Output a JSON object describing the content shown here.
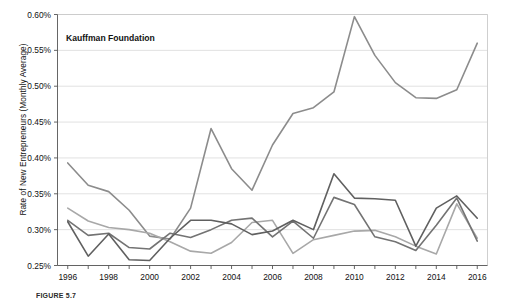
{
  "figure": {
    "caption": "FIGURE 5.7",
    "annotation": "Kauffman Foundation",
    "ylabel": "Rate of New Entrepreneurs (Monthly Average)"
  },
  "chart_data": {
    "type": "line",
    "title": "",
    "annotation": "Kauffman Foundation",
    "xlabel": "",
    "ylabel": "Rate of New Entrepreneurs (Monthly Average)",
    "xlim": [
      1995.5,
      2016.5
    ],
    "ylim": [
      0.0025,
      0.006
    ],
    "ylim_percent": [
      0.25,
      0.6
    ],
    "grid": true,
    "legend": "none",
    "y_tick_labels": [
      "0.60%",
      "0.55%",
      "0.50%",
      "0.45%",
      "0.40%",
      "0.35%",
      "0.30%",
      "0.25%"
    ],
    "y_tick_values": [
      0.6,
      0.55,
      0.5,
      0.45,
      0.4,
      0.35,
      0.3,
      0.25
    ],
    "x_tick_labels": [
      "1996",
      "1998",
      "2000",
      "2002",
      "2004",
      "2006",
      "2008",
      "2010",
      "2012",
      "2014",
      "2016"
    ],
    "x_tick_values": [
      1996,
      1998,
      2000,
      2002,
      2004,
      2006,
      2008,
      2010,
      2012,
      2014,
      2016
    ],
    "x_minor_ticks": [
      1997,
      1999,
      2001,
      2003,
      2005,
      2007,
      2009,
      2011,
      2013,
      2015
    ],
    "x": [
      1996,
      1997,
      1998,
      1999,
      2000,
      2001,
      2002,
      2003,
      2004,
      2005,
      2006,
      2007,
      2008,
      2009,
      2010,
      2011,
      2012,
      2013,
      2014,
      2015,
      2016
    ],
    "series": [
      {
        "name": "series-1",
        "color": "#8c8c8c",
        "values": [
          0.393,
          0.362,
          0.353,
          0.327,
          0.291,
          0.287,
          0.33,
          0.441,
          0.385,
          0.355,
          0.418,
          0.462,
          0.47,
          0.492,
          0.597,
          0.543,
          0.505,
          0.484,
          0.483,
          0.495,
          0.56
        ]
      },
      {
        "name": "series-2",
        "color": "#a8a8a8",
        "values": [
          0.33,
          0.312,
          0.303,
          0.3,
          0.295,
          0.283,
          0.27,
          0.267,
          0.282,
          0.31,
          0.313,
          0.267,
          0.286,
          0.292,
          0.298,
          0.299,
          0.29,
          0.277,
          0.266,
          0.336,
          0.288
        ]
      },
      {
        "name": "series-3",
        "color": "#737373",
        "values": [
          0.313,
          0.292,
          0.295,
          0.275,
          0.273,
          0.295,
          0.289,
          0.3,
          0.313,
          0.316,
          0.29,
          0.312,
          0.288,
          0.345,
          0.335,
          0.29,
          0.283,
          0.271,
          0.306,
          0.344,
          0.284
        ]
      },
      {
        "name": "series-4",
        "color": "#606060",
        "values": [
          0.311,
          0.263,
          0.294,
          0.258,
          0.257,
          0.288,
          0.313,
          0.313,
          0.308,
          0.293,
          0.298,
          0.313,
          0.3,
          0.378,
          0.344,
          0.343,
          0.341,
          0.277,
          0.33,
          0.347,
          0.316
        ]
      }
    ]
  }
}
